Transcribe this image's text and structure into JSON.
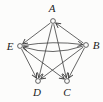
{
  "figure": {
    "background": "#fcfcfb",
    "stroke_color": "#3f3f3f",
    "label_color": "#1c1c1c",
    "node_radius": 2.4,
    "node_fill": "#fcfcfb",
    "nodes": [
      {
        "id": "A",
        "label": "A",
        "x": 53,
        "y": 21,
        "label_x": 52,
        "label_y": 12
      },
      {
        "id": "E",
        "label": "E",
        "x": 20,
        "y": 46,
        "label_x": 10,
        "label_y": 50
      },
      {
        "id": "B",
        "label": "B",
        "x": 86,
        "y": 45,
        "label_x": 96,
        "label_y": 49
      },
      {
        "id": "D",
        "label": "D",
        "x": 38,
        "y": 81,
        "label_x": 37,
        "label_y": 96
      },
      {
        "id": "C",
        "label": "C",
        "x": 67,
        "y": 81,
        "label_x": 67,
        "label_y": 96
      }
    ],
    "edges": [
      {
        "from": "B",
        "to": "A",
        "type": "line"
      },
      {
        "from": "A",
        "to": "E",
        "type": "line"
      },
      {
        "from": "E",
        "to": "B",
        "type": "arc",
        "bend_x": 53,
        "bend_y": 40.5
      },
      {
        "from": "B",
        "to": "E",
        "type": "arc",
        "bend_x": 53,
        "bend_y": 56.5
      },
      {
        "from": "A",
        "to": "D",
        "type": "line"
      },
      {
        "from": "E",
        "to": "D",
        "type": "line"
      },
      {
        "from": "B",
        "to": "D",
        "type": "line"
      },
      {
        "from": "A",
        "to": "C",
        "type": "line"
      },
      {
        "from": "E",
        "to": "C",
        "type": "line"
      },
      {
        "from": "B",
        "to": "C",
        "type": "line"
      }
    ]
  }
}
